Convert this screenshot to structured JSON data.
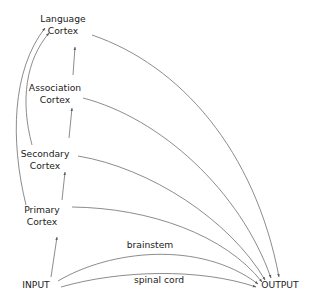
{
  "diagram": {
    "nodes": {
      "language": {
        "line1": "Language",
        "line2": "Cortex"
      },
      "association": {
        "line1": "Association",
        "line2": "Cortex"
      },
      "secondary": {
        "line1": "Secondary",
        "line2": "Cortex"
      },
      "primary": {
        "line1": "Primary",
        "line2": "Cortex"
      },
      "input": {
        "label": "INPUT"
      },
      "output": {
        "label": "OUTPUT"
      }
    },
    "edge_labels": {
      "brainstem": "brainstem",
      "spinal_cord": "spinal cord"
    },
    "edges": [
      {
        "from": "INPUT",
        "to": "Primary Cortex"
      },
      {
        "from": "Primary Cortex",
        "to": "Secondary Cortex"
      },
      {
        "from": "Secondary Cortex",
        "to": "Association Cortex"
      },
      {
        "from": "Association Cortex",
        "to": "Language Cortex"
      },
      {
        "from": "Primary Cortex",
        "to": "Language Cortex"
      },
      {
        "from": "Secondary Cortex",
        "to": "Language Cortex"
      },
      {
        "from": "Language Cortex",
        "to": "OUTPUT"
      },
      {
        "from": "Association Cortex",
        "to": "OUTPUT"
      },
      {
        "from": "Secondary Cortex",
        "to": "OUTPUT"
      },
      {
        "from": "Primary Cortex",
        "to": "OUTPUT"
      },
      {
        "from": "INPUT",
        "to": "OUTPUT",
        "label": "brainstem"
      },
      {
        "from": "INPUT",
        "to": "OUTPUT",
        "label": "spinal cord"
      }
    ],
    "colors": {
      "line": "#5a5a5a",
      "text": "#222222",
      "background": "#ffffff"
    }
  }
}
